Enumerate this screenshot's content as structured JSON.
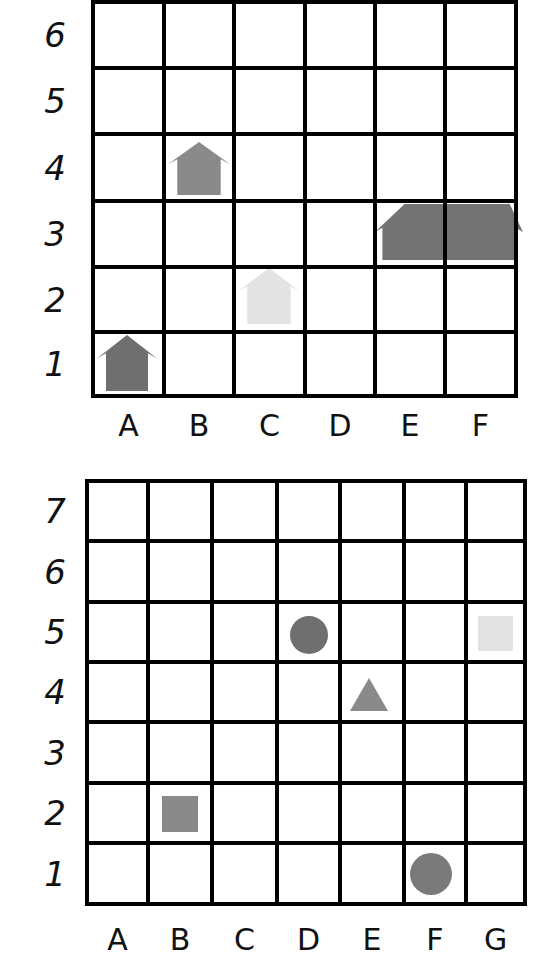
{
  "grids": [
    {
      "id": "top-grid",
      "columns": [
        "A",
        "B",
        "C",
        "D",
        "E",
        "F"
      ],
      "rows": [
        "6",
        "5",
        "4",
        "3",
        "2",
        "1"
      ],
      "x_lines": [
        93,
        164,
        234,
        305,
        375,
        445,
        516
      ],
      "y_lines": [
        2,
        68,
        134,
        201,
        267,
        332,
        396
      ],
      "col_label_y": 426,
      "row_label_x": 55,
      "shapes": [
        {
          "name": "house-icon",
          "type": "house",
          "cell": "B4",
          "color": "#8a8a8a",
          "x": 168,
          "y": 142,
          "w": 62,
          "h": 53
        },
        {
          "name": "house-icon",
          "type": "house",
          "cell": "C2",
          "color": "#e3e3e3",
          "x": 238,
          "y": 268,
          "w": 62,
          "h": 56
        },
        {
          "name": "house-icon",
          "type": "house",
          "cell": "A1",
          "color": "#6f6f6f",
          "x": 97,
          "y": 335,
          "w": 60,
          "h": 56
        },
        {
          "name": "wide-house-icon",
          "type": "wide-house",
          "cell": "E3-F3",
          "color": "#737373",
          "x": 375,
          "y": 204,
          "w": 148,
          "h": 56
        }
      ]
    },
    {
      "id": "bottom-grid",
      "columns": [
        "A",
        "B",
        "C",
        "D",
        "E",
        "F",
        "G"
      ],
      "rows": [
        "7",
        "6",
        "5",
        "4",
        "3",
        "2",
        "1"
      ],
      "x_lines": [
        87,
        148,
        212,
        277,
        340,
        404,
        466,
        525
      ],
      "y_lines": [
        481,
        541,
        602,
        662,
        722,
        783,
        843,
        904
      ],
      "col_label_y": 940,
      "row_label_x": 55,
      "shapes": [
        {
          "name": "circle-icon",
          "type": "circle",
          "cell": "D5",
          "color": "#6f6f6f",
          "cx": 309,
          "cy": 635,
          "r": 19
        },
        {
          "name": "square-icon",
          "type": "square",
          "cell": "G5",
          "color": "#e3e3e3",
          "x": 478,
          "y": 616,
          "w": 35,
          "h": 35
        },
        {
          "name": "triangle-icon",
          "type": "triangle",
          "cell": "E4",
          "color": "#8a8a8a",
          "x": 350,
          "y": 678,
          "w": 38,
          "h": 33
        },
        {
          "name": "square-icon",
          "type": "square",
          "cell": "B2",
          "color": "#8a8a8a",
          "x": 162,
          "y": 796,
          "w": 36,
          "h": 36
        },
        {
          "name": "circle-icon",
          "type": "circle",
          "cell": "F1",
          "color": "#7a7a7a",
          "cx": 431,
          "cy": 874,
          "r": 21
        }
      ]
    }
  ],
  "style": {
    "line_color": "#000000",
    "line_width": 4,
    "background": "#ffffff"
  }
}
